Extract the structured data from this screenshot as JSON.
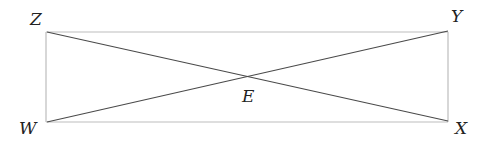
{
  "diagram": {
    "title": "",
    "colors": {
      "rectangle_stroke": "#bdbdbd",
      "diagonal_stroke": "#4a4a4a",
      "label": "#222222"
    },
    "vertices": [
      {
        "id": "Z",
        "label": "Z",
        "role": "top-left"
      },
      {
        "id": "Y",
        "label": "Y",
        "role": "top-right"
      },
      {
        "id": "X",
        "label": "X",
        "role": "bottom-right"
      },
      {
        "id": "W",
        "label": "W",
        "role": "bottom-left"
      }
    ],
    "intersection": {
      "id": "E",
      "label": "E"
    },
    "segments": [
      {
        "from": "W",
        "to": "X",
        "kind": "side"
      },
      {
        "from": "X",
        "to": "Y",
        "kind": "side"
      },
      {
        "from": "Y",
        "to": "Z",
        "kind": "side"
      },
      {
        "from": "Z",
        "to": "W",
        "kind": "side"
      },
      {
        "from": "Z",
        "to": "X",
        "kind": "diagonal"
      },
      {
        "from": "W",
        "to": "Y",
        "kind": "diagonal"
      }
    ]
  }
}
